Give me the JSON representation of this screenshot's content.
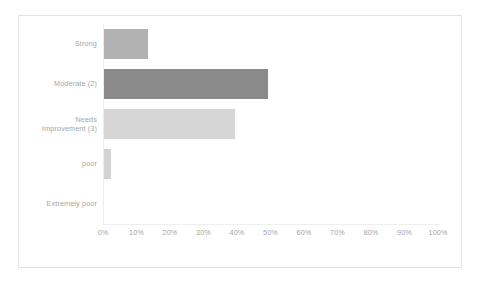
{
  "chart_data": {
    "type": "bar",
    "orientation": "horizontal",
    "title": "",
    "xlabel": "",
    "ylabel": "",
    "xlim": [
      0,
      100
    ],
    "xtick_labels": [
      "0%",
      "10%",
      "20%",
      "30%",
      "40%",
      "50%",
      "60%",
      "70%",
      "80%",
      "90%",
      "100%"
    ],
    "xtick_values": [
      0,
      10,
      20,
      30,
      40,
      50,
      60,
      70,
      80,
      90,
      100
    ],
    "grid": false,
    "legend": false,
    "categories": [
      "Strong",
      "Moderate (2)",
      "Needs\nImprovement (3)",
      "poor",
      "Extremely poor"
    ],
    "values": [
      13,
      49,
      39,
      2,
      0
    ],
    "bar_colors": [
      "#b2b2b2",
      "#8a8a8a",
      "#d5d5d5",
      "#d3d3d3",
      "#d3d3d3"
    ],
    "bars": [
      {
        "label": "Strong",
        "value": 13,
        "color": "#b2b2b2"
      },
      {
        "label": "Moderate (2)",
        "value": 49,
        "color": "#8a8a8a"
      },
      {
        "label": "Needs\nImprovement (3)",
        "value": 39,
        "color": "#d5d5d5"
      },
      {
        "label": "poor",
        "value": 2,
        "color": "#d3d3d3"
      },
      {
        "label": "Extremely poor",
        "value": 0,
        "color": "#d3d3d3"
      }
    ]
  },
  "style": {
    "background": "#ffffff",
    "border_color": "#e2e2e2",
    "axis_color": "#ededed",
    "label_color": "#a5a5a5"
  }
}
